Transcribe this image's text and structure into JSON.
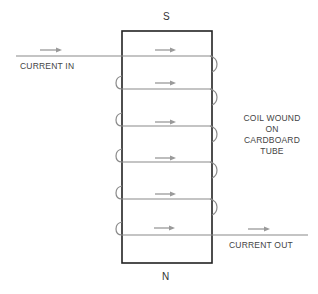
{
  "poles": {
    "top": "S",
    "bottom": "N"
  },
  "labels": {
    "current_in": "CURRENT IN",
    "current_out": "CURRENT OUT",
    "coil_note": [
      "COIL WOUND",
      "ON",
      "CARDBOARD",
      "TUBE"
    ]
  },
  "colors": {
    "tube_outline": "#222222",
    "wire": "#8a8a8a",
    "arrow": "#9a9a9a",
    "text": "#444444"
  },
  "geometry": {
    "tube": {
      "x": 122,
      "y": 31,
      "width": 90,
      "height": 232
    },
    "winding_count": 6,
    "winding_y": [
      56,
      89,
      126,
      162,
      199,
      235
    ],
    "wire_in_start_x": 16,
    "wire_out_end_x": 308
  }
}
